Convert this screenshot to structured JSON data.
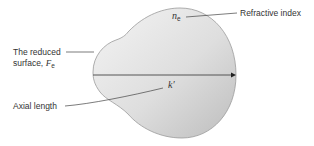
{
  "diagram": {
    "type": "reduced-eye-model",
    "labels": {
      "refractive_index": "Refractive index",
      "reduced_surface_line1": "The reduced",
      "reduced_surface_line2": "surface,",
      "reduced_surface_symbol": "F",
      "reduced_surface_subscript": "e",
      "axial_length": "Axial length"
    },
    "symbols": {
      "refractive_index_symbol": "n",
      "refractive_index_subscript": "e",
      "axial_length_symbol": "k′"
    },
    "colors": {
      "shape_fill_light": "#f2f2f2",
      "shape_fill_dark": "#c4c4c4",
      "shape_stroke": "#9a9a9a",
      "axis_line": "#555555",
      "leader_line": "#444444",
      "text": "#333333"
    }
  }
}
